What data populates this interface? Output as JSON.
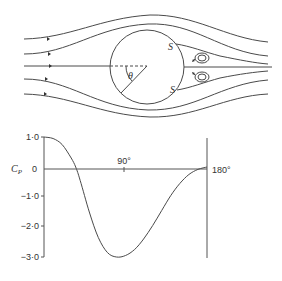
{
  "flow_diagram": {
    "angle_label": "θ",
    "separation_upper_label": "S",
    "separation_lower_label": "S"
  },
  "chart_data": {
    "type": "line",
    "title": "",
    "xlabel": "θ",
    "ylabel": "Cp",
    "ylabel_main": "C",
    "ylabel_sub": "P",
    "xlim": [
      0,
      180
    ],
    "ylim": [
      -3.0,
      1.0
    ],
    "y_ticks": [
      "1·0",
      "0",
      "−1·0",
      "−2·0",
      "−3·0"
    ],
    "x_tick_labels": [
      "90°",
      "180°"
    ],
    "grid": false,
    "x": [
      0,
      10,
      20,
      30,
      35,
      40,
      50,
      60,
      70,
      80,
      90,
      100,
      110,
      120,
      130,
      140,
      150,
      160,
      170,
      180
    ],
    "values": [
      1.0,
      0.95,
      0.75,
      0.3,
      0.0,
      -0.45,
      -1.5,
      -2.35,
      -2.85,
      -3.0,
      -2.95,
      -2.75,
      -2.4,
      -1.95,
      -1.45,
      -0.95,
      -0.55,
      -0.25,
      -0.08,
      0.0
    ]
  }
}
